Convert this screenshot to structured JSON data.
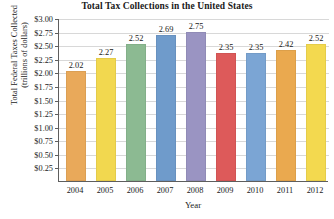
{
  "chart_data": {
    "type": "bar",
    "title": "Total Tax Collections in the United States",
    "xlabel": "Year",
    "ylabel": "Total Federal Taxes Collected",
    "ylabel_line2": "(trillions of dollars)",
    "categories": [
      "2004",
      "2005",
      "2006",
      "2007",
      "2008",
      "2009",
      "2010",
      "2011",
      "2012"
    ],
    "values": [
      2.02,
      2.27,
      2.52,
      2.69,
      2.75,
      2.35,
      2.35,
      2.42,
      2.52
    ],
    "value_labels": [
      "2.02",
      "2.27",
      "2.52",
      "2.69",
      "2.75",
      "2.35",
      "2.35",
      "2.42",
      "2.52"
    ],
    "bar_colors": [
      "#e9a95a",
      "#f2d84f",
      "#8cba92",
      "#6f9bcb",
      "#9a94c2",
      "#dd5a5a",
      "#7ba5d4",
      "#eaa94f",
      "#f3d94f"
    ],
    "ylim": [
      0,
      3.0
    ],
    "ytick_values": [
      0.25,
      0.5,
      0.75,
      1.0,
      1.25,
      1.5,
      1.75,
      2.0,
      2.25,
      2.5,
      2.75,
      3.0
    ],
    "ytick_labels": [
      "$0.25",
      "$0.50",
      "$0.75",
      "$1.00",
      "$1.25",
      "$1.50",
      "$1.75",
      "$2.00",
      "$2.25",
      "$2.50",
      "$2.75",
      "$3.00"
    ],
    "grid": true,
    "legend": "none",
    "axis_color": "#5e5e5e",
    "gridline_color": "#d8d8d8"
  }
}
